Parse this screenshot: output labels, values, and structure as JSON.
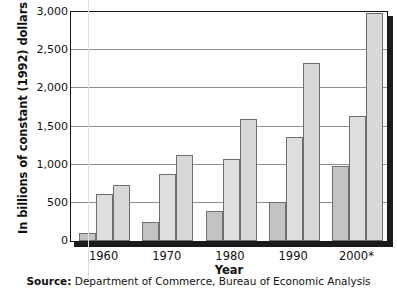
{
  "chart_data": {
    "type": "bar",
    "title": "",
    "xlabel": "Year",
    "ylabel": "In billions of constant (1992) dollars",
    "categories": [
      "1960",
      "1970",
      "1980",
      "1990",
      "2000*"
    ],
    "series": [
      {
        "name": "series-1",
        "values": [
          100,
          245,
          390,
          515,
          985
        ],
        "color": "#c3c3c3"
      },
      {
        "name": "series-2",
        "values": [
          620,
          880,
          1070,
          1360,
          1640
        ],
        "color": "#dedede"
      },
      {
        "name": "series-3",
        "values": [
          740,
          1130,
          1600,
          2330,
          2990
        ],
        "color": "#d8d8d8"
      }
    ],
    "ylim": [
      0,
      3000
    ],
    "ytick_labels": [
      "0",
      "500",
      "1,000",
      "1,500",
      "2,000",
      "2,500",
      "3,000"
    ],
    "ytick_values": [
      0,
      500,
      1000,
      1500,
      2000,
      2500,
      3000
    ],
    "grid": true,
    "legend": "none",
    "source_prefix": "Source:",
    "source_text": "Department of Commerce, Bureau of Economic Analysis"
  }
}
